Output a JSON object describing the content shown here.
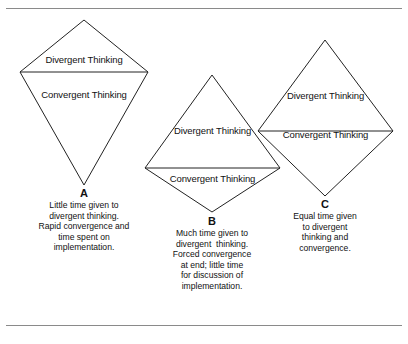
{
  "figure": {
    "rules": {
      "top_divider": "horizontal-rule",
      "bottom_divider": "horizontal-rule"
    },
    "shapes": [
      {
        "id": "A",
        "letter": "A",
        "upper_label": "Divergent Thinking",
        "lower_label": "Convergent Thinking",
        "caption_lines": [
          "Little time given to",
          "divergent thinking.",
          "Rapid convergence and",
          "time spent on",
          "implementation."
        ]
      },
      {
        "id": "B",
        "letter": "B",
        "upper_label": "Divergent Thinking",
        "lower_label": "Convergent Thinking",
        "caption_lines": [
          "Much time given to",
          "divergent  thinking.",
          "Forced convergence",
          "at end; little time",
          "for discussion of",
          "implementation."
        ]
      },
      {
        "id": "C",
        "letter": "C",
        "upper_label": "Divergent Thinking",
        "lower_label": "Convergent Thinking",
        "caption_lines": [
          "Equal time given",
          "to divergent",
          "thinking and",
          "convergence."
        ]
      }
    ]
  }
}
